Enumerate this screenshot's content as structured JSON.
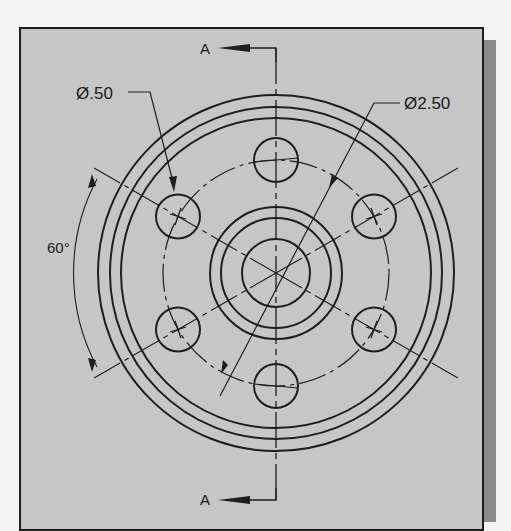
{
  "drawing": {
    "title": "Flange top view with section line A-A",
    "section_label_top": "A",
    "section_label_bottom": "A",
    "hole_diameter_label": "Ø.50",
    "bolt_circle_diameter_label": "Ø2.50",
    "angle_label": "60°",
    "hole_count": 6,
    "hole_angle_spacing_deg": 60
  },
  "colors": {
    "paper": "#c6c6c6",
    "line": "#1e1e1e",
    "shadow": "#8a8a8a",
    "background": "#f4f4f4"
  }
}
